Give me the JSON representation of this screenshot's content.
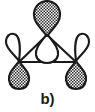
{
  "figure": {
    "caption": "b)",
    "colors": {
      "stroke": "#1a1a1a",
      "shaded_lobe_fill": "#6b6b6b",
      "shaded_lobe_pattern": "checkerboard-stipple",
      "empty_lobe_fill": "#ffffff",
      "background": "#ffffff"
    },
    "geometry": {
      "vertices": [
        {
          "name": "top-atom",
          "x": 47,
          "y": 35
        },
        {
          "name": "bottom-left-atom",
          "x": 19,
          "y": 62
        },
        {
          "name": "bottom-right-atom",
          "x": 76,
          "y": 62
        }
      ],
      "bonds": [
        {
          "name": "bond-top-left",
          "from": "top-atom",
          "to": "bottom-left-atom"
        },
        {
          "name": "bond-top-right",
          "from": "top-atom",
          "to": "bottom-right-atom"
        },
        {
          "name": "bond-bottom",
          "from": "bottom-left-atom",
          "to": "bottom-right-atom"
        }
      ]
    },
    "orbitals": [
      {
        "name": "top-orbital",
        "position": "top",
        "upper_lobe": {
          "phase": "shaded",
          "direction": "up"
        },
        "lower_lobe": {
          "phase": "empty",
          "direction": "down"
        }
      },
      {
        "name": "bottom-left-orbital",
        "position": "bottom-left",
        "upper_lobe": {
          "phase": "empty",
          "direction": "up"
        },
        "lower_lobe": {
          "phase": "shaded",
          "direction": "down"
        }
      },
      {
        "name": "bottom-right-orbital",
        "position": "bottom-right",
        "upper_lobe": {
          "phase": "empty",
          "direction": "up"
        },
        "lower_lobe": {
          "phase": "shaded",
          "direction": "down"
        }
      }
    ]
  }
}
